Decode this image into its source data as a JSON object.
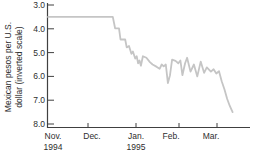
{
  "chart_data": {
    "type": "line",
    "title": "",
    "y_axis_label": [
      "Mexican pesos per U.S.",
      "dollar (inverted scale)"
    ],
    "y_axis": {
      "min": 3.0,
      "max": 8.0,
      "inverted": true,
      "tick_values": [
        3,
        4,
        5,
        6,
        7,
        8
      ],
      "tick_labels": [
        "3.0",
        "4.0",
        "5.0",
        "6.0",
        "7.0",
        "8.0"
      ]
    },
    "x_axis": {
      "range": "Nov 1994 - Mar 1995",
      "months": [
        {
          "label": "Nov.",
          "year": "1994"
        },
        {
          "label": "Dec.",
          "year": ""
        },
        {
          "label": "Jan.",
          "year": "1995"
        },
        {
          "label": "Feb.",
          "year": ""
        },
        {
          "label": "Mar.",
          "year": ""
        }
      ],
      "tick_month_offsets_days": [
        30,
        61,
        92,
        120
      ]
    },
    "grid": false,
    "legend": false,
    "background": "#ffffff",
    "axis_color": "#404040",
    "text_color": "#2e2e2e",
    "series": [
      {
        "name": "Mexican pesos per U.S. dollar (inverted scale)",
        "color": "#c5c5c5",
        "x_unit": "days since Nov 1 1994",
        "points_day_value": [
          [
            0,
            3.5
          ],
          [
            46,
            3.5
          ],
          [
            47.5,
            3.98
          ],
          [
            50,
            3.98
          ],
          [
            51,
            4.45
          ],
          [
            54,
            4.45
          ],
          [
            55,
            4.78
          ],
          [
            56.5,
            4.72
          ],
          [
            58,
            5.05
          ],
          [
            59,
            4.95
          ],
          [
            60.5,
            5.25
          ],
          [
            61.5,
            5.15
          ],
          [
            62.5,
            5.45
          ],
          [
            63.5,
            5.33
          ],
          [
            64.5,
            5.55
          ],
          [
            66,
            5.15
          ],
          [
            68.5,
            5.22
          ],
          [
            71,
            5.4
          ],
          [
            73,
            5.5
          ],
          [
            76,
            5.6
          ],
          [
            78,
            5.68
          ],
          [
            79.5,
            5.5
          ],
          [
            81,
            5.58
          ],
          [
            82.5,
            5.5
          ],
          [
            84,
            6.28
          ],
          [
            85.5,
            5.95
          ],
          [
            87,
            5.3
          ],
          [
            89.5,
            5.35
          ],
          [
            91.5,
            5.45
          ],
          [
            93,
            5.33
          ],
          [
            94.5,
            5.95
          ],
          [
            96.5,
            5.45
          ],
          [
            98,
            5.22
          ],
          [
            100.5,
            5.8
          ],
          [
            103,
            5.5
          ],
          [
            105.5,
            6.0
          ],
          [
            108,
            5.38
          ],
          [
            110.5,
            5.85
          ],
          [
            112.5,
            5.62
          ],
          [
            115.5,
            5.8
          ],
          [
            117.5,
            5.7
          ],
          [
            119.5,
            5.88
          ],
          [
            121.5,
            5.78
          ],
          [
            123.5,
            6.2
          ],
          [
            125.5,
            6.55
          ],
          [
            127.5,
            6.95
          ],
          [
            129.5,
            7.25
          ],
          [
            131.5,
            7.5
          ]
        ]
      }
    ]
  }
}
